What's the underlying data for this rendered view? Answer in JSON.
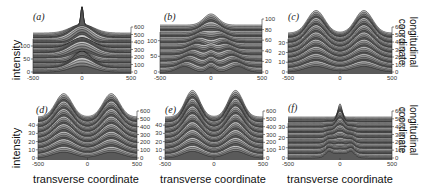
{
  "chart_data": [
    {
      "type": "area",
      "panel": "(a)",
      "style": "waterfall",
      "xlabel": "",
      "ylabel": "intensity",
      "zlabel": "",
      "xticks": [
        "-500",
        "0",
        "500"
      ],
      "xlim": [
        -500,
        500
      ],
      "yticks_left": [
        "0",
        "50",
        "100"
      ],
      "ylim_left": [
        0,
        150
      ],
      "yticks_right": [
        "0",
        "100",
        "200",
        "300",
        "400",
        "500",
        "600"
      ],
      "ylim_right": [
        0,
        600
      ],
      "profile": {
        "kind": "central-spike-breathing",
        "peak_x": 0,
        "width": 120,
        "amplitude": 0.55
      }
    },
    {
      "type": "area",
      "panel": "(b)",
      "style": "waterfall",
      "xlabel": "",
      "ylabel": "",
      "zlabel": "",
      "xticks": [
        "-500",
        "0",
        "500"
      ],
      "xlim": [
        -500,
        500
      ],
      "yticks_left": [
        "0",
        "50",
        "100"
      ],
      "ylim_left": [
        0,
        150
      ],
      "yticks_right": [
        "0",
        "20",
        "40",
        "60",
        "80",
        "100"
      ],
      "ylim_right": [
        0,
        100
      ],
      "profile": {
        "kind": "diverging-x",
        "start_x": 0,
        "end_x": 250,
        "width": 70,
        "amplitude": 0.35
      }
    },
    {
      "type": "area",
      "panel": "(c)",
      "style": "waterfall",
      "xlabel": "",
      "ylabel": "",
      "zlabel": "longitudinal coordinate",
      "xticks": [
        "-500",
        "0",
        "500"
      ],
      "xlim": [
        -500,
        500
      ],
      "yticks_left": [
        "0",
        "10",
        "20",
        "30"
      ],
      "ylim_left": [
        0,
        40
      ],
      "yticks_right": [
        "0",
        "100",
        "200",
        "300",
        "400",
        "500",
        "600"
      ],
      "ylim_right": [
        0,
        600
      ],
      "profile": {
        "kind": "two-humps",
        "peak_x": 230,
        "width": 110,
        "amplitude": 0.9
      }
    },
    {
      "type": "area",
      "panel": "(d)",
      "style": "waterfall",
      "xlabel": "transverse coordinate",
      "ylabel": "intensity",
      "zlabel": "",
      "xticks": [
        "-500",
        "0",
        "500"
      ],
      "xlim": [
        -500,
        500
      ],
      "yticks_left": [
        "0",
        "10",
        "20",
        "30",
        "40"
      ],
      "ylim_left": [
        0,
        50
      ],
      "yticks_right": [
        "0",
        "100",
        "200",
        "300",
        "400",
        "500",
        "600"
      ],
      "ylim_right": [
        0,
        600
      ],
      "profile": {
        "kind": "two-humps",
        "peak_x": 240,
        "width": 110,
        "amplitude": 0.9
      }
    },
    {
      "type": "area",
      "panel": "(e)",
      "style": "waterfall",
      "xlabel": "transverse coordinate",
      "ylabel": "",
      "zlabel": "",
      "xticks": [
        "-500",
        "0",
        "500"
      ],
      "xlim": [
        -500,
        500
      ],
      "yticks_left": [
        "0",
        "10",
        "20",
        "30",
        "40"
      ],
      "ylim_left": [
        0,
        50
      ],
      "yticks_right": [
        "0",
        "100",
        "200",
        "300",
        "400",
        "500",
        "600"
      ],
      "ylim_right": [
        0,
        600
      ],
      "profile": {
        "kind": "two-humps",
        "peak_x": 220,
        "width": 100,
        "amplitude": 0.95
      }
    },
    {
      "type": "area",
      "panel": "(f)",
      "style": "waterfall",
      "xlabel": "transverse coordinate",
      "ylabel": "",
      "zlabel": "longitudinal coordinate",
      "xticks": [
        "-500",
        "0",
        "500"
      ],
      "xlim": [
        -500,
        500
      ],
      "yticks_left": [
        "0",
        "10",
        "20",
        "30"
      ],
      "ylim_left": [
        0,
        40
      ],
      "yticks_right": [
        "0",
        "100",
        "200",
        "300",
        "400",
        "500",
        "600"
      ],
      "ylim_right": [
        0,
        600
      ],
      "profile": {
        "kind": "central-spike-collapse",
        "peak_x": 0,
        "width": 90,
        "amplitude": 0.6
      }
    }
  ],
  "labels": {
    "ylabel_intensity": "intensity",
    "xlabel_transverse": "transverse coordinate",
    "zlabel_line1": "longitudinal",
    "zlabel_line2": "coordinate"
  }
}
